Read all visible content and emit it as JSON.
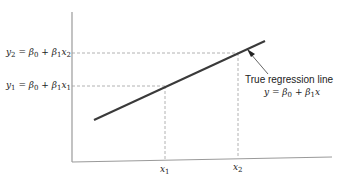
{
  "diagram": {
    "type": "regression-illustration",
    "title": "True regression line",
    "equation": {
      "lhs": "y",
      "beta0": "β",
      "beta0_sub": "0",
      "plus": "+",
      "beta1": "β",
      "beta1_sub": "1",
      "var": "x"
    },
    "y_labels": [
      {
        "lhs": "y",
        "lhs_sub": "2",
        "beta0": "β",
        "beta0_sub": "0",
        "beta1": "β",
        "beta1_sub": "1",
        "var": "x",
        "var_sub": "2"
      },
      {
        "lhs": "y",
        "lhs_sub": "1",
        "beta0": "β",
        "beta0_sub": "0",
        "beta1": "β",
        "beta1_sub": "1",
        "var": "x",
        "var_sub": "1"
      }
    ],
    "x_labels": [
      {
        "var": "x",
        "sub": "1"
      },
      {
        "var": "x",
        "sub": "2"
      }
    ],
    "colors": {
      "line": "#3a3a3a",
      "axis": "#9a9a9a",
      "dashed": "#a0a0a0",
      "text": "#222222"
    }
  }
}
